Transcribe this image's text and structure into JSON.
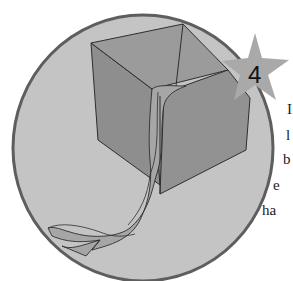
{
  "illustration": {
    "subject": "open paper box with ribbon strip",
    "colors": {
      "background": "#ffffff",
      "circle_fill": "#c4c4c4",
      "circle_border": "#5e5e5e",
      "box_face": "#8f8f8f",
      "box_face_dark": "#868686",
      "box_inner": "#9a9a9a",
      "ribbon": "#a6a6a6",
      "outline": "#2e2e2e",
      "star": "#a9a9a9"
    }
  },
  "step_badge": {
    "icon": "star-icon",
    "number": "4"
  },
  "text_fragments": [
    {
      "text": "I",
      "x": 288,
      "y": 113
    },
    {
      "text": "l",
      "x": 286,
      "y": 140
    },
    {
      "text": "b",
      "x": 284,
      "y": 165
    },
    {
      "text": "e",
      "x": 274,
      "y": 191
    },
    {
      "text": "ha",
      "x": 262,
      "y": 217
    }
  ]
}
